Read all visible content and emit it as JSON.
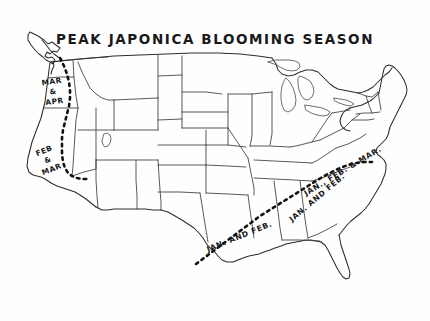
{
  "figure": {
    "title": "PEAK JAPONICA BLOOMING SEASON",
    "kind": "hand-drawn-map",
    "region": "United States",
    "background_color": "#fefefe",
    "ink_color": "#2d2d2d",
    "divider_color": "#111111",
    "width": 430,
    "height": 321
  },
  "zones": [
    {
      "id": "pacific-northwest",
      "label_lines": [
        "MAR",
        "&",
        "APR"
      ],
      "label_text": "MAR & APR",
      "area": "Pacific Northwest (Washington, Oregon)",
      "x": 52,
      "y": 84,
      "rotate": -8
    },
    {
      "id": "california",
      "label_lines": [
        "FEB",
        "&",
        "MAR"
      ],
      "label_text": "FEB & MAR",
      "area": "California coast",
      "x": 45,
      "y": 153,
      "rotate": -22
    },
    {
      "id": "gulf-coast",
      "label_lines": [
        "JAN. AND FEB."
      ],
      "label_text": "JAN. AND FEB.",
      "area": "Gulf Coast (Texas, Louisiana)",
      "x": 208,
      "y": 252,
      "rotate": -22
    },
    {
      "id": "deep-south",
      "label_lines": [
        "JAN. AND FEB."
      ],
      "label_text": "JAN. AND FEB.",
      "area": "Deep South (Alabama, Georgia)",
      "x": 292,
      "y": 222,
      "rotate": -40
    },
    {
      "id": "carolinas",
      "label_lines": [
        "JAN., FEB. & MAR."
      ],
      "label_text": "JAN., FEB. & MAR.",
      "area": "Carolinas / Mid-Atlantic coast",
      "x": 306,
      "y": 196,
      "rotate": -31
    }
  ],
  "legend_note": {
    "divider_style": "dashed",
    "divider_meaning": "boundary of peak blooming zone"
  }
}
